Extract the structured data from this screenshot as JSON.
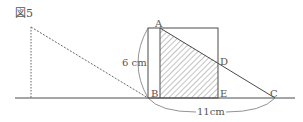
{
  "figure": {
    "title": "図5",
    "points": {
      "A": "A",
      "B": "B",
      "C": "C",
      "D": "D",
      "E": "E"
    },
    "dimensions": {
      "height": "6 cm",
      "base": "11cm"
    },
    "colors": {
      "line": "#4a4a4a",
      "hatch": "#6a6a6a",
      "text": "#555555"
    }
  }
}
